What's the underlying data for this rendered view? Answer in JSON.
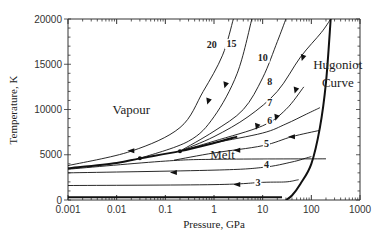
{
  "chart_data": {
    "type": "line",
    "title": "",
    "xlabel": "Pressure, GPa",
    "ylabel": "Temperature, K",
    "xscale": "log",
    "xlim": [
      0.001,
      1000
    ],
    "ylim": [
      0,
      20000
    ],
    "x_ticks": [
      "0.001",
      "0.01",
      "0.1",
      "1",
      "10",
      "100",
      "1000"
    ],
    "y_ticks": [
      "0",
      "5000",
      "10000",
      "15000",
      "20000"
    ],
    "grid": false,
    "legend": null,
    "annotations": [
      {
        "text": "Vapour",
        "x": 0.02,
        "y": 9500
      },
      {
        "text": "Melt",
        "x": 1.5,
        "y": 4500
      },
      {
        "text": "Hugoniot",
        "x": 350,
        "y": 14500
      },
      {
        "text": "Curve",
        "x": 350,
        "y": 12500
      }
    ],
    "series": [
      {
        "name": "Hugoniot Curve",
        "style": "bold",
        "points": [
          [
            30,
            0
          ],
          [
            40,
            500
          ],
          [
            60,
            1800
          ],
          [
            100,
            4000
          ],
          [
            150,
            8000
          ],
          [
            200,
            13000
          ],
          [
            250,
            20000
          ]
        ]
      },
      {
        "name": "Liquid-vapour boundary",
        "style": "bold",
        "points": [
          [
            0.001,
            3500
          ],
          [
            0.01,
            4100
          ],
          [
            0.03,
            4600
          ],
          [
            0.2,
            5400
          ],
          [
            1,
            6300
          ],
          [
            3,
            7000
          ]
        ]
      },
      {
        "name": "Melt line",
        "points": [
          [
            0.001,
            3400
          ],
          [
            0.1,
            4300
          ],
          [
            1.2,
            4500
          ],
          [
            200,
            4550
          ]
        ]
      },
      {
        "name": "3",
        "label": "3",
        "points": [
          [
            0.001,
            1600
          ],
          [
            1,
            1700
          ],
          [
            10,
            1950
          ],
          [
            30,
            2000
          ],
          [
            50,
            2200
          ],
          [
            55,
            2250
          ]
        ]
      },
      {
        "name": "4",
        "label": "4",
        "points": [
          [
            0.001,
            3000
          ],
          [
            1,
            3300
          ],
          [
            10,
            3600
          ],
          [
            40,
            4200
          ],
          [
            80,
            4650
          ],
          [
            100,
            4800
          ]
        ]
      },
      {
        "name": "5",
        "label": "5",
        "points": [
          [
            0.15,
            4400
          ],
          [
            1,
            5200
          ],
          [
            10,
            6000
          ],
          [
            40,
            7000
          ],
          [
            150,
            7700
          ]
        ]
      },
      {
        "name": "6",
        "label": "6",
        "points": [
          [
            0.2,
            5400
          ],
          [
            1,
            6300
          ],
          [
            10,
            7400
          ],
          [
            30,
            8400
          ],
          [
            80,
            9500
          ],
          [
            150,
            10200
          ]
        ]
      },
      {
        "name": "7",
        "label": "7",
        "points": [
          [
            0.2,
            5400
          ],
          [
            1,
            6500
          ],
          [
            10,
            8200
          ],
          [
            30,
            10000
          ],
          [
            70,
            12500
          ]
        ]
      },
      {
        "name": "8",
        "label": "8",
        "points": [
          [
            0.2,
            5400
          ],
          [
            1,
            7000
          ],
          [
            5,
            9200
          ],
          [
            20,
            12000
          ],
          [
            60,
            15800
          ],
          [
            160,
            18500
          ],
          [
            250,
            20000
          ]
        ]
      },
      {
        "name": "10",
        "label": "10",
        "points": [
          [
            0.2,
            5400
          ],
          [
            1,
            7600
          ],
          [
            4,
            10000
          ],
          [
            10,
            13500
          ],
          [
            20,
            17500
          ],
          [
            30,
            20000
          ]
        ]
      },
      {
        "name": "15",
        "label": "15",
        "points": [
          [
            0.03,
            4600
          ],
          [
            0.3,
            6500
          ],
          [
            1,
            9200
          ],
          [
            3,
            14000
          ],
          [
            6,
            20000
          ]
        ]
      },
      {
        "name": "20",
        "label": "20",
        "points": [
          [
            0.001,
            3800
          ],
          [
            0.02,
            5400
          ],
          [
            0.2,
            8000
          ],
          [
            0.6,
            12000
          ],
          [
            1.5,
            16000
          ],
          [
            2.5,
            20000
          ]
        ]
      }
    ]
  }
}
